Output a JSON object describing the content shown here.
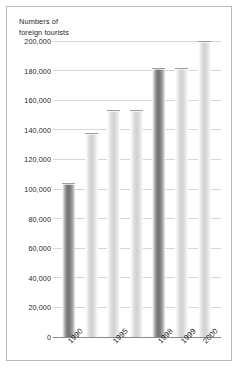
{
  "chart_data": {
    "type": "bar",
    "title": "Numbers of\nforeign tourists",
    "xlabel": "",
    "ylabel": "",
    "ylim": [
      0,
      200000
    ],
    "grid": true,
    "legend": "none",
    "categories": [
      "1990",
      "",
      "1995",
      "",
      "1998",
      "1999",
      "2000"
    ],
    "tick_labels": [
      "1990",
      "1995",
      "1998",
      "1999",
      "2000"
    ],
    "values": [
      104000,
      138000,
      153500,
      153500,
      182000,
      182000,
      182000
    ],
    "bars": [
      {
        "label": "1990",
        "value": 104000,
        "shade": "dark"
      },
      {
        "label": "",
        "value": 138000,
        "shade": "light"
      },
      {
        "label": "1995",
        "value": 153500,
        "shade": "light"
      },
      {
        "label": "",
        "value": 153500,
        "shade": "light"
      },
      {
        "label": "1998",
        "value": 182000,
        "shade": "dark"
      },
      {
        "label": "1999",
        "value": 182000,
        "shade": "light"
      },
      {
        "label": "2000",
        "value": 200000,
        "shade": "light"
      }
    ],
    "yticks": [
      0,
      20000,
      40000,
      60000,
      80000,
      100000,
      120000,
      140000,
      160000,
      180000,
      200000
    ],
    "ytick_labels": [
      "0",
      "20,000",
      "40,000",
      "60,000",
      "80,000",
      "100,000",
      "120,000",
      "140,000",
      "160,000",
      "180,000",
      "200,000"
    ],
    "colors": {
      "background": "#ffffff",
      "frame": "#b9b9b9",
      "gridline": "#d7d7d7",
      "axis": "#8a8a8a",
      "bar_dark": "#707070",
      "bar_light": "#d2d2d2",
      "text": "#1f1f1f"
    }
  }
}
